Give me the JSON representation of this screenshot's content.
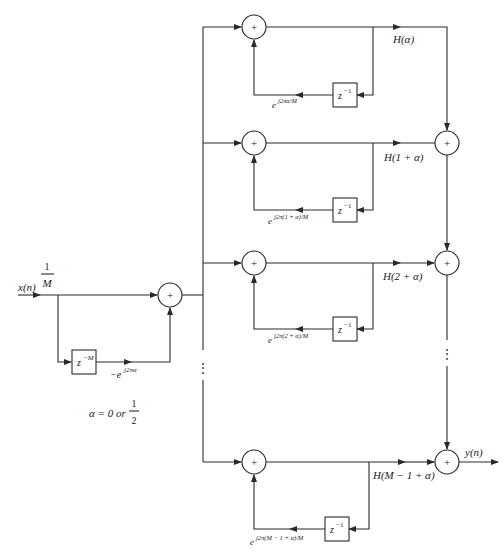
{
  "diagram": {
    "type": "block-diagram",
    "input": {
      "label": "x(n)",
      "gain_num": "1",
      "gain_den": "M"
    },
    "comb": {
      "delay_label": "z",
      "delay_exp": "−M",
      "coef_label": "−e",
      "coef_exp": "j2πα"
    },
    "note": {
      "text": "α = 0 or",
      "frac_num": "1",
      "frac_den": "2"
    },
    "adder_symbol": "+",
    "branches": [
      {
        "gain": "H(α)",
        "delay_base": "z",
        "delay_exp": "−1",
        "coef_base": "e",
        "coef_exp": "j2πα/M"
      },
      {
        "gain": "H(1 + α)",
        "delay_base": "z",
        "delay_exp": "−1",
        "coef_base": "e",
        "coef_exp": "j2π(1 + α)/M"
      },
      {
        "gain": "H(2 + α)",
        "delay_base": "z",
        "delay_exp": "−1",
        "coef_base": "e",
        "coef_exp": "j2π(2 + α)/M"
      },
      {
        "gain": "H(M − 1 + α)",
        "delay_base": "z",
        "delay_exp": "−1",
        "coef_base": "e",
        "coef_exp": "j2π(M − 1 + α)/M"
      }
    ],
    "ellipsis": "⋮",
    "output": {
      "label": "y(n)"
    }
  }
}
